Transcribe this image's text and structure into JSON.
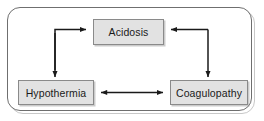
{
  "figure": {
    "frame": {
      "name": "rounded-border",
      "border_color": "#6f6f6f",
      "background_color": "#ffffff"
    },
    "style": {
      "node_fill": "#e2e2e2",
      "node_border": "#8a8a8a",
      "arrow_color": "#1a1a1a",
      "text_color": "#1a1a1a"
    }
  },
  "nodes": [
    {
      "id": "acidosis",
      "label": "Acidosis"
    },
    {
      "id": "hypothermia",
      "label": "Hypothermia"
    },
    {
      "id": "coagulopathy",
      "label": "Coagulopathy"
    }
  ],
  "edges": [
    {
      "id": "hypothermia-to-acidosis",
      "from": "hypothermia",
      "to": "acidosis",
      "style": "elbow",
      "direction": "one-way"
    },
    {
      "id": "acidosis-to-hypothermia",
      "from": "acidosis",
      "to": "hypothermia",
      "style": "elbow",
      "direction": "one-way"
    },
    {
      "id": "coagulopathy-to-acidosis",
      "from": "coagulopathy",
      "to": "acidosis",
      "style": "elbow",
      "direction": "one-way"
    },
    {
      "id": "acidosis-to-coagulopathy",
      "from": "acidosis",
      "to": "coagulopathy",
      "style": "elbow",
      "direction": "one-way"
    },
    {
      "id": "hypothermia-coagulopathy",
      "from": "hypothermia",
      "to": "coagulopathy",
      "style": "straight",
      "direction": "bidirectional"
    }
  ]
}
